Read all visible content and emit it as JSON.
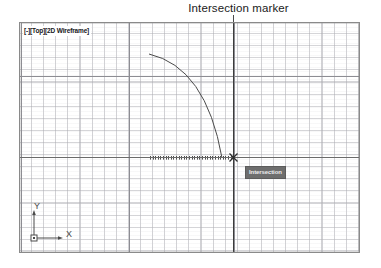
{
  "annotation": {
    "caption": "Intersection marker",
    "leader_icon": "leader-line"
  },
  "viewport": {
    "title": "[-][Top][2D Wireframe]",
    "projection": "Top",
    "display_mode": "2D Wireframe",
    "background_color": "#ffffff",
    "border_color": "#8a8a8a",
    "grid": {
      "visible": true,
      "minor_pitch_px": 12,
      "minor_color": "#acacb2",
      "major_color": "#8d8d93",
      "major_vertical_positions": [
        1,
        109,
        214,
        340
      ],
      "major_horizontal_positions": [
        53,
        134
      ]
    },
    "geometry": {
      "type": "arc",
      "stroke_color": "#4a4a4a",
      "stroke_width": 1,
      "start_point": [
        129,
        31
      ],
      "end_point": [
        202,
        135
      ],
      "control_point": [
        186,
        44
      ]
    },
    "tracking_line": {
      "visible": true,
      "style": "dotted",
      "color": "#4d4d4d",
      "from": [
        130,
        134
      ],
      "to": [
        215,
        134
      ]
    },
    "crosshair": {
      "color": "#3c3c3c",
      "vertical_x": 213,
      "horizontal_y": 134
    },
    "snap_marker": {
      "type": "intersection",
      "icon": "intersection-x-marker",
      "color": "#2e2e2e",
      "position": [
        213,
        134
      ]
    },
    "osnap_tooltip": {
      "label": "Intersection",
      "background_color": "#6e6e6e",
      "text_color": "#ececed"
    },
    "axis_gizmo": {
      "icon": "axis-indicator",
      "color": "#4a4a4a",
      "y_label": "Y",
      "x_label": "X",
      "origin_icon": "origin-square"
    }
  }
}
